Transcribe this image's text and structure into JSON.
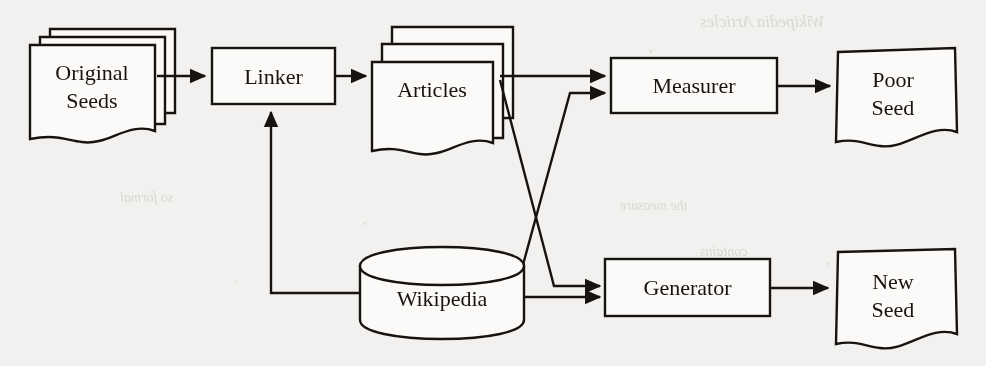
{
  "figure": {
    "medium": "scanned-paper-figure",
    "background_color": "#f2f1ef",
    "ink_color": "#17140f",
    "shape_fill": "#fbfaf8",
    "nodes": [
      {
        "id": "original-seeds",
        "label_line1": "Original",
        "label_line2": "Seeds",
        "shape": "document-stack",
        "stack": 3
      },
      {
        "id": "linker",
        "label_line1": "Linker",
        "label_line2": "",
        "shape": "process-box",
        "stack": 1
      },
      {
        "id": "articles",
        "label_line1": "Articles",
        "label_line2": "",
        "shape": "document-stack",
        "stack": 3
      },
      {
        "id": "measurer",
        "label_line1": "Measurer",
        "label_line2": "",
        "shape": "process-box",
        "stack": 1
      },
      {
        "id": "poor-seed",
        "label_line1": "Poor",
        "label_line2": "Seed",
        "shape": "document",
        "stack": 1
      },
      {
        "id": "wikipedia",
        "label_line1": "Wikipedia",
        "label_line2": "",
        "shape": "database-cylinder",
        "stack": 1
      },
      {
        "id": "generator",
        "label_line1": "Generator",
        "label_line2": "",
        "shape": "process-box",
        "stack": 1
      },
      {
        "id": "new-seed",
        "label_line1": "New",
        "label_line2": "Seed",
        "shape": "document",
        "stack": 1
      }
    ],
    "edges": [
      {
        "id": "edge-original-seeds-to-linker",
        "from": "original-seeds",
        "to": "linker",
        "style": "straight"
      },
      {
        "id": "edge-linker-to-articles",
        "from": "linker",
        "to": "articles",
        "style": "straight"
      },
      {
        "id": "edge-articles-to-measurer",
        "from": "articles",
        "to": "measurer",
        "style": "straight"
      },
      {
        "id": "edge-articles-to-generator",
        "from": "articles",
        "to": "generator",
        "style": "crossing-diagonal"
      },
      {
        "id": "edge-wikipedia-to-measurer",
        "from": "wikipedia",
        "to": "measurer",
        "style": "crossing-diagonal"
      },
      {
        "id": "edge-wikipedia-to-generator",
        "from": "wikipedia",
        "to": "generator",
        "style": "straight"
      },
      {
        "id": "edge-wikipedia-to-linker",
        "from": "wikipedia",
        "to": "linker",
        "style": "feedback-elbow"
      },
      {
        "id": "edge-measurer-to-poor-seed",
        "from": "measurer",
        "to": "poor-seed",
        "style": "straight"
      },
      {
        "id": "edge-generator-to-new-seed",
        "from": "generator",
        "to": "new-seed",
        "style": "straight"
      }
    ],
    "bleedthrough": [
      {
        "id": "bleed-1",
        "text": "Wikipedia Articles",
        "x": 700,
        "y": 24,
        "size": 17
      },
      {
        "id": "bleed-2",
        "text": "so formal",
        "x": 120,
        "y": 198,
        "size": 14
      },
      {
        "id": "bleed-3",
        "text": "the measure",
        "x": 620,
        "y": 206,
        "size": 14
      },
      {
        "id": "bleed-4",
        "text": "contains",
        "x": 700,
        "y": 252,
        "size": 14
      }
    ]
  }
}
